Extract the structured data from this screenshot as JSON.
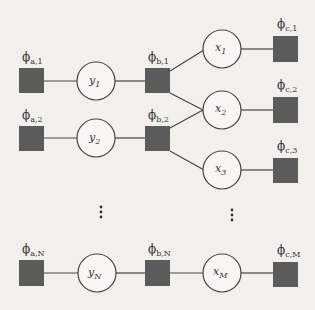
{
  "diagram": {
    "type": "factor-graph",
    "colors": {
      "factor": "#5b5b5b",
      "edge": "#444444",
      "node_stroke": "#444444",
      "background": "#f1f0ec"
    },
    "factors_a": [
      {
        "id": "phi_a1",
        "symbol": "ϕ",
        "sub": "a,1"
      },
      {
        "id": "phi_a2",
        "symbol": "ϕ",
        "sub": "a,2"
      },
      {
        "id": "phi_aN",
        "symbol": "ϕ",
        "sub": "a,N"
      }
    ],
    "variables_y": [
      {
        "id": "y1",
        "symbol": "y",
        "sub": "1"
      },
      {
        "id": "y2",
        "symbol": "y",
        "sub": "2"
      },
      {
        "id": "yN",
        "symbol": "y",
        "sub": "N"
      }
    ],
    "factors_b": [
      {
        "id": "phi_b1",
        "symbol": "ϕ",
        "sub": "b,1"
      },
      {
        "id": "phi_b2",
        "symbol": "ϕ",
        "sub": "b,2"
      },
      {
        "id": "phi_bN",
        "symbol": "ϕ",
        "sub": "b,N"
      }
    ],
    "variables_x": [
      {
        "id": "x1",
        "symbol": "x",
        "sub": "1"
      },
      {
        "id": "x2",
        "symbol": "x",
        "sub": "2"
      },
      {
        "id": "x3",
        "symbol": "x",
        "sub": "3"
      },
      {
        "id": "xM",
        "symbol": "x",
        "sub": "M"
      }
    ],
    "factors_c": [
      {
        "id": "phi_c1",
        "symbol": "ϕ",
        "sub": "c,1"
      },
      {
        "id": "phi_c2",
        "symbol": "ϕ",
        "sub": "c,2"
      },
      {
        "id": "phi_c3",
        "symbol": "ϕ",
        "sub": "c,3"
      },
      {
        "id": "phi_cM",
        "symbol": "ϕ",
        "sub": "c,M"
      }
    ],
    "edges": [
      [
        "phi_a1",
        "y1"
      ],
      [
        "y1",
        "phi_b1"
      ],
      [
        "phi_b1",
        "x1"
      ],
      [
        "phi_b1",
        "x2"
      ],
      [
        "x1",
        "phi_c1"
      ],
      [
        "phi_a2",
        "y2"
      ],
      [
        "y2",
        "phi_b2"
      ],
      [
        "phi_b2",
        "x2"
      ],
      [
        "phi_b2",
        "x3"
      ],
      [
        "x2",
        "phi_c2"
      ],
      [
        "x3",
        "phi_c3"
      ],
      [
        "phi_aN",
        "yN"
      ],
      [
        "yN",
        "phi_bN"
      ],
      [
        "phi_bN",
        "xM"
      ],
      [
        "xM",
        "phi_cM"
      ]
    ],
    "ellipsis": "⋮"
  }
}
